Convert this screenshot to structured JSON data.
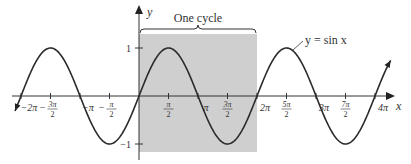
{
  "chart_data": {
    "type": "line",
    "title": "",
    "function": "y = sin x",
    "curve_label": "y = sin x",
    "xlabel": "x",
    "ylabel": "y",
    "x_range_radians": [
      -6.6,
      13.4
    ],
    "ylim": [
      -1,
      1
    ],
    "x_ticks": [
      {
        "label": "−2π",
        "value": -6.2832
      },
      {
        "label": "−3π/2",
        "value": -4.7124
      },
      {
        "label": "−π",
        "value": -3.1416
      },
      {
        "label": "−π/2",
        "value": -1.5708
      },
      {
        "label": "π/2",
        "value": 1.5708
      },
      {
        "label": "π",
        "value": 3.1416
      },
      {
        "label": "3π/2",
        "value": 4.7124
      },
      {
        "label": "2π",
        "value": 6.2832
      },
      {
        "label": "5π/2",
        "value": 7.854
      },
      {
        "label": "3π",
        "value": 9.4248
      },
      {
        "label": "7π/2",
        "value": 10.9956
      },
      {
        "label": "4π",
        "value": 12.5664
      }
    ],
    "y_ticks": [
      {
        "label": "1",
        "value": 1
      },
      {
        "label": "−1",
        "value": -1
      }
    ],
    "annotation": {
      "label": "One cycle",
      "from": 0,
      "to": 6.2832,
      "shaded": true
    },
    "grid": false,
    "legend": "none",
    "colors": {
      "curve": "#2a2a2a",
      "shade": "#cfcfcf",
      "axis": "#333333"
    }
  }
}
